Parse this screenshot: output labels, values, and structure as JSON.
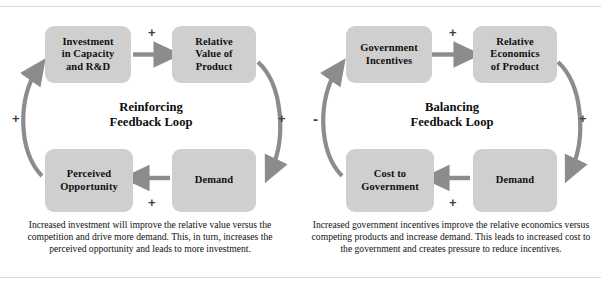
{
  "figure": {
    "type": "causal-loop-diagram-pair",
    "background_color": "#ffffff",
    "node_fill_color": "#cfcfcf",
    "arrow_color": "#8c8c8c",
    "text_color": "#111111"
  },
  "loops": [
    {
      "id": "reinforcing",
      "title": "Reinforcing\nFeedback Loop",
      "title_line1": "Reinforcing",
      "title_line2": "Feedback Loop",
      "nodes": {
        "top_left": "Investment in Capacity and R&D",
        "top_left_line1": "Investment",
        "top_left_line2": "in Capacity",
        "top_left_line3": "and R&D",
        "top_right": "Relative Value of Product",
        "top_right_line1": "Relative",
        "top_right_line2": "Value of",
        "top_right_line3": "Product",
        "bottom_left": "Perceived Opportunity",
        "bottom_left_line1": "Perceived",
        "bottom_left_line2": "Opportunity",
        "bottom_right": "Demand"
      },
      "signs": {
        "top": "+",
        "right": "+",
        "bottom": "+",
        "left": "+"
      },
      "caption": "Increased investment will improve the relative value versus the competition and drive more demand.  This, in turn, increases the perceived opportunity and leads to more investment."
    },
    {
      "id": "balancing",
      "title": "Balancing\nFeedback Loop",
      "title_line1": "Balancing",
      "title_line2": "Feedback Loop",
      "nodes": {
        "top_left": "Government Incentives",
        "top_left_line1": "Government",
        "top_left_line2": "Incentives",
        "top_right": "Relative Economics of Product",
        "top_right_line1": "Relative",
        "top_right_line2": "Economics",
        "top_right_line3": "of Product",
        "bottom_left": "Cost to Government",
        "bottom_left_line1": "Cost to",
        "bottom_left_line2": "Government",
        "bottom_right": "Demand"
      },
      "signs": {
        "top": "+",
        "right": "+",
        "bottom": "+",
        "left": "-"
      },
      "caption": "Increased government incentives improve the relative economics versus competing products and increase demand.  This leads to increased cost to the government and creates pressure to reduce incentives."
    }
  ]
}
